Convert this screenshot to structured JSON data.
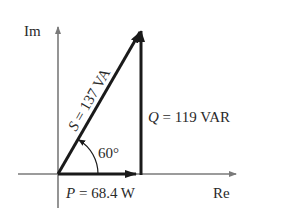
{
  "diagram": {
    "type": "power-triangle",
    "axes": {
      "imag_label": "Im",
      "real_label": "Re"
    },
    "vectors": {
      "apparent": {
        "symbol": "S",
        "eq": " = ",
        "value": "137 VA",
        "label": "S = 137 VA"
      },
      "reactive": {
        "symbol": "Q",
        "eq": " = ",
        "value": "119 VAR",
        "label": "Q = 119 VAR"
      },
      "real": {
        "symbol": "P",
        "eq": " = ",
        "value": "68.4 W",
        "label": "P = 68.4 W"
      }
    },
    "angle": {
      "label": "60°",
      "degrees": 60
    },
    "colors": {
      "axis": "#7a7a7a",
      "vector": "#1a1a1a",
      "text": "#2a2a2a"
    }
  }
}
